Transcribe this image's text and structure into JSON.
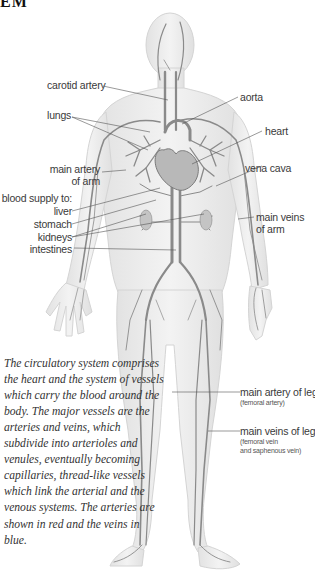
{
  "heading": "EM",
  "labels": {
    "carotid_artery": "carotid artery",
    "aorta": "aorta",
    "lungs": "lungs",
    "heart": "heart",
    "main_artery_of_arm_line1": "main artery",
    "main_artery_of_arm_line2": "of arm",
    "vena_cava": "vena cava",
    "blood_supply_to": "blood supply to:",
    "liver": "liver",
    "stomach": "stomach",
    "kidneys": "kidneys",
    "intestines": "intestines",
    "main_veins_of_arm_line1": "main veins",
    "main_veins_of_arm_line2": "of arm",
    "main_artery_of_leg": "main artery of leg",
    "main_artery_of_leg_sub": "(femoral artery)",
    "main_veins_of_leg": "main veins of leg",
    "main_veins_of_leg_sub1": "(femoral vein",
    "main_veins_of_leg_sub2": "and saphenous vein)"
  },
  "caption": "The circulatory system comprises the heart and the system of vessels which carry the blood around the body.  The major vessels are the arteries and veins, which subdivide into arterioles and venules, eventually becoming capillaries, thread-like vessels which link the arterial and the venous systems. The arteries are shown in red and the veins in blue.",
  "colors": {
    "body_fill": "#eeeeee",
    "body_edge": "#d2d2d2",
    "vessel": "#8a8a8a",
    "leader": "#555555"
  }
}
